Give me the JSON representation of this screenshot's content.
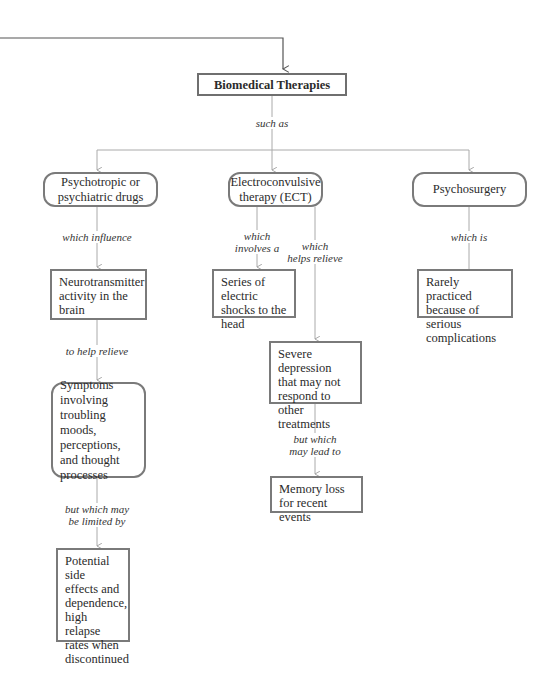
{
  "diagram": {
    "root": {
      "label": "Biomedical Therapies"
    },
    "root_connector_label": "such as",
    "branches": [
      {
        "label": "Psychotropic or psychiatric drugs",
        "edge_label": "which influence",
        "child": "Neurotransmitter activity in the brain",
        "edge2_label": "to help relieve",
        "grandchild": "Symptoms involving troubling moods, perceptions, and thought processes",
        "edge3_label": "but which may\nbe limited by",
        "great_grandchild": "Potential side effects and dependence, high relapse rates when discontinued"
      },
      {
        "label": "Electroconvulsive therapy (ECT)",
        "edge_label_a": "which\ninvolves a",
        "child_a": "Series of electric shocks to the head",
        "edge_label_b": "which\nhelps relieve",
        "child_b": "Severe depression that may not respond to other treatments",
        "edge2_label": "but which\nmay lead to",
        "grandchild": "Memory loss for recent events"
      },
      {
        "label": "Psychosurgery",
        "edge_label": "which is",
        "child": "Rarely practiced because of serious complications"
      }
    ]
  },
  "colors": {
    "border": "#7a7a7a",
    "connector": "#a8a8a8",
    "incoming_connector": "#555555"
  }
}
